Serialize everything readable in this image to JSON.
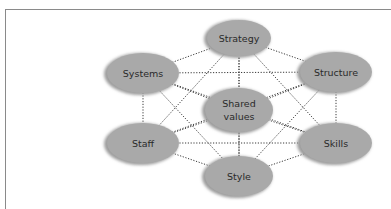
{
  "diagram": {
    "type": "network",
    "title": "",
    "colors": {
      "node_fill": "#a9a9a9",
      "node_shadow": "#9c9c9c",
      "edge": "#3a3a3a",
      "text": "#2a2a2a",
      "frame": "#8a8a8a"
    },
    "nodes": [
      {
        "id": "strategy",
        "label": "Strategy",
        "cx": 239,
        "cy": 38,
        "rx": 32,
        "ry": 18
      },
      {
        "id": "systems",
        "label": "Systems",
        "cx": 143,
        "cy": 73,
        "rx": 36,
        "ry": 20
      },
      {
        "id": "structure",
        "label": "Structure",
        "cx": 336,
        "cy": 72,
        "rx": 36,
        "ry": 20
      },
      {
        "id": "shared_values",
        "label": "Shared values",
        "lines": [
          "Shared",
          "values"
        ],
        "cx": 239,
        "cy": 110,
        "rx": 34,
        "ry": 22
      },
      {
        "id": "staff",
        "label": "Staff",
        "cx": 143,
        "cy": 143,
        "rx": 36,
        "ry": 20
      },
      {
        "id": "skills",
        "label": "Skills",
        "cx": 336,
        "cy": 143,
        "rx": 36,
        "ry": 20
      },
      {
        "id": "style",
        "label": "Style",
        "cx": 239,
        "cy": 176,
        "rx": 34,
        "ry": 20
      }
    ],
    "edges": [
      [
        "strategy",
        "systems"
      ],
      [
        "strategy",
        "structure"
      ],
      [
        "strategy",
        "shared_values"
      ],
      [
        "strategy",
        "staff"
      ],
      [
        "strategy",
        "skills"
      ],
      [
        "strategy",
        "style"
      ],
      [
        "systems",
        "structure"
      ],
      [
        "systems",
        "shared_values"
      ],
      [
        "systems",
        "staff"
      ],
      [
        "systems",
        "skills"
      ],
      [
        "systems",
        "style"
      ],
      [
        "structure",
        "shared_values"
      ],
      [
        "structure",
        "staff"
      ],
      [
        "structure",
        "skills"
      ],
      [
        "structure",
        "style"
      ],
      [
        "shared_values",
        "staff"
      ],
      [
        "shared_values",
        "skills"
      ],
      [
        "shared_values",
        "style"
      ],
      [
        "staff",
        "skills"
      ],
      [
        "staff",
        "style"
      ],
      [
        "skills",
        "style"
      ]
    ],
    "edge_style": "dotted"
  },
  "labels": {
    "strategy": "Strategy",
    "systems": "Systems",
    "structure": "Structure",
    "shared_values_line1": "Shared",
    "shared_values_line2": "values",
    "staff": "Staff",
    "skills": "Skills",
    "style": "Style"
  }
}
